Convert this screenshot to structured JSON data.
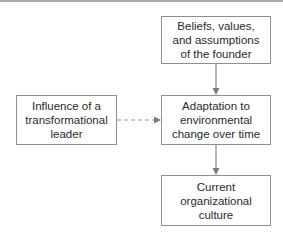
{
  "diagram": {
    "type": "flowchart",
    "nodes": [
      {
        "id": "founder",
        "label": "Beliefs, values,\nand assumptions\nof the founder"
      },
      {
        "id": "adaptation",
        "label": "Adaptation to\nenvironmental\nchange over time"
      },
      {
        "id": "culture",
        "label": "Current\norganizational\nculture"
      },
      {
        "id": "leader",
        "label": "Influence of a\ntransformational\nleader"
      }
    ],
    "edges": [
      {
        "from": "founder",
        "to": "adaptation",
        "style": "solid"
      },
      {
        "from": "adaptation",
        "to": "culture",
        "style": "solid"
      },
      {
        "from": "leader",
        "to": "adaptation",
        "style": "dashed"
      }
    ],
    "colors": {
      "border": "#8f8f8f",
      "arrow": "#8a8a8a",
      "text": "#2a2a2a"
    }
  }
}
